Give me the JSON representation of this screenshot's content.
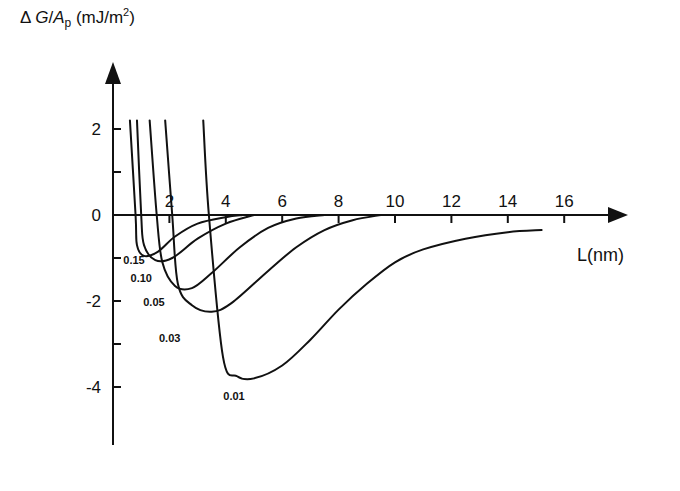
{
  "chart_data": {
    "type": "line",
    "title": "",
    "xlabel": "L(nm)",
    "ylabel": "ΔG/Ap (mJ/m2)",
    "ylabel_parts": {
      "delta": "Δ",
      "G": "G",
      "slash": "/",
      "A": "A",
      "sub": "p",
      "unit_open": " (mJ/m",
      "sup": "2",
      "unit_close": ")"
    },
    "xlim": [
      0,
      18
    ],
    "ylim": [
      -4.6,
      2.8
    ],
    "x_ticks": [
      2,
      4,
      6,
      8,
      10,
      12,
      14,
      16
    ],
    "y_tick_labels": [
      2,
      0,
      -2,
      -4
    ],
    "y_minor_ticks": [
      1,
      -1,
      -3
    ],
    "grid": false,
    "legend": "none (curves labeled inline)",
    "series": [
      {
        "name": "0.15",
        "label": "0.15",
        "points": [
          [
            0.6,
            2.2
          ],
          [
            0.8,
            0
          ],
          [
            0.85,
            -0.7
          ],
          [
            1.1,
            -0.95
          ],
          [
            1.6,
            -0.85
          ],
          [
            2.2,
            -0.5
          ],
          [
            3,
            -0.2
          ],
          [
            4,
            -0.05
          ],
          [
            4.6,
            0
          ]
        ]
      },
      {
        "name": "0.10",
        "label": "0.10",
        "points": [
          [
            0.85,
            2.2
          ],
          [
            1.0,
            0
          ],
          [
            1.1,
            -0.7
          ],
          [
            1.5,
            -1.05
          ],
          [
            2.1,
            -1.0
          ],
          [
            3,
            -0.55
          ],
          [
            4,
            -0.2
          ],
          [
            5,
            0
          ]
        ]
      },
      {
        "name": "0.05",
        "label": "0.05",
        "points": [
          [
            1.3,
            2.2
          ],
          [
            1.55,
            0
          ],
          [
            1.75,
            -1.1
          ],
          [
            2.2,
            -1.65
          ],
          [
            2.8,
            -1.7
          ],
          [
            3.5,
            -1.35
          ],
          [
            4.5,
            -0.75
          ],
          [
            5.5,
            -0.3
          ],
          [
            6.5,
            -0.08
          ],
          [
            7.5,
            0
          ]
        ]
      },
      {
        "name": "0.03",
        "label": "0.03",
        "points": [
          [
            1.85,
            2.2
          ],
          [
            2.1,
            0
          ],
          [
            2.3,
            -1.6
          ],
          [
            2.8,
            -2.1
          ],
          [
            3.5,
            -2.25
          ],
          [
            4.2,
            -2.05
          ],
          [
            5.5,
            -1.3
          ],
          [
            6.5,
            -0.75
          ],
          [
            7.5,
            -0.35
          ],
          [
            8.5,
            -0.12
          ],
          [
            9.5,
            0
          ]
        ]
      },
      {
        "name": "0.01",
        "label": "0.01",
        "points": [
          [
            3.2,
            2.2
          ],
          [
            3.4,
            0
          ],
          [
            3.9,
            -3.3
          ],
          [
            4.4,
            -3.75
          ],
          [
            5,
            -3.8
          ],
          [
            6,
            -3.5
          ],
          [
            7,
            -2.9
          ],
          [
            8,
            -2.2
          ],
          [
            9,
            -1.6
          ],
          [
            10,
            -1.1
          ],
          [
            11,
            -0.8
          ],
          [
            12.5,
            -0.55
          ],
          [
            14,
            -0.4
          ],
          [
            15.2,
            -0.35
          ]
        ]
      }
    ]
  }
}
